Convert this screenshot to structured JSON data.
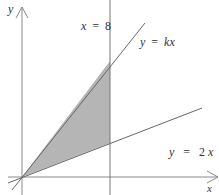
{
  "diagram": {
    "axes": {
      "x_label": "x",
      "y_label": "y"
    },
    "lines": [
      {
        "id": "vertical",
        "label_var": "x",
        "label_eq": "=",
        "label_val": "8"
      },
      {
        "id": "kx",
        "label_var": "y",
        "label_eq": "=",
        "label_expr": "kx"
      },
      {
        "id": "2x",
        "label_var": "y",
        "label_eq": "=",
        "label_coef": "2",
        "label_x": "x"
      }
    ],
    "shaded_region": "triangle between y = kx, y = 2x and x = 8",
    "colors": {
      "shade": "#b3b3b3",
      "line": "#666666",
      "axis": "#888888"
    }
  }
}
